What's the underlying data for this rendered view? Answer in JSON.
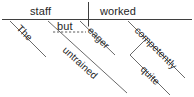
{
  "diagram": {
    "type": "reed-kellogg-sentence-diagram",
    "sentence": "The untrained but eager staff worked quite competently.",
    "ink_color": "#3f3f3f",
    "text_color": "#262626",
    "background_color": "#ffffff",
    "baseline": {
      "subject": "staff",
      "predicate": "worked",
      "divider": "vertical-bar"
    },
    "words": {
      "subject": "staff",
      "verb": "worked",
      "article": "The",
      "adjective_one": "untrained",
      "conjunction": "but",
      "adjective_two": "eager",
      "adverb": "competently",
      "adverb_modifier": "quite"
    },
    "branches": [
      {
        "id": "the",
        "label": "The",
        "attaches_to": "staff",
        "kind": "article-modifier"
      },
      {
        "id": "untrained",
        "label": "untrained",
        "attaches_to": "staff",
        "kind": "adjective-modifier"
      },
      {
        "id": "eager",
        "label": "eager",
        "attaches_to": "staff",
        "kind": "adjective-modifier"
      },
      {
        "id": "but",
        "label": "but",
        "attaches_to": "untrained-eager",
        "kind": "conjunction-dashed"
      },
      {
        "id": "competently",
        "label": "competently",
        "attaches_to": "worked",
        "kind": "adverb-modifier"
      },
      {
        "id": "quite",
        "label": "quite",
        "attaches_to": "competently",
        "kind": "adverb-of-adverb"
      }
    ]
  }
}
